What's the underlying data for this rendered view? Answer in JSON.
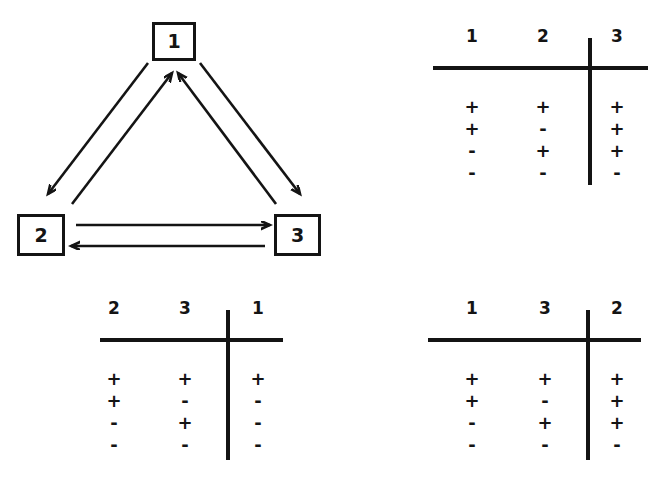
{
  "figure": {
    "kind": "state-transition-diagram-with-truth-tables",
    "background_color": "#ffffff",
    "ink_color": "#141414"
  },
  "diagram": {
    "name": "three-node-cycle",
    "nodes": [
      {
        "id": "1",
        "label": "1"
      },
      {
        "id": "2",
        "label": "2"
      },
      {
        "id": "3",
        "label": "3"
      }
    ],
    "edges": [
      {
        "from": "1",
        "to": "2",
        "direction": "down-left"
      },
      {
        "from": "2",
        "to": "1",
        "direction": "up-right"
      },
      {
        "from": "1",
        "to": "3",
        "direction": "down-right"
      },
      {
        "from": "3",
        "to": "1",
        "direction": "up-left"
      },
      {
        "from": "2",
        "to": "3",
        "direction": "right"
      },
      {
        "from": "3",
        "to": "2",
        "direction": "left"
      }
    ]
  },
  "tables": {
    "top_right": {
      "name": "truth-table-output-3",
      "inputs": [
        "1",
        "2"
      ],
      "output": "3",
      "headers": [
        "1",
        "2",
        "3"
      ],
      "rows": [
        [
          "+",
          "+",
          "+"
        ],
        [
          "+",
          "-",
          "+"
        ],
        [
          "-",
          "+",
          "+"
        ],
        [
          "-",
          "-",
          "-"
        ]
      ]
    },
    "bottom_left": {
      "name": "truth-table-output-1",
      "inputs": [
        "2",
        "3"
      ],
      "output": "1",
      "headers": [
        "2",
        "3",
        "1"
      ],
      "rows": [
        [
          "+",
          "+",
          "+"
        ],
        [
          "+",
          "-",
          "-"
        ],
        [
          "-",
          "+",
          "-"
        ],
        [
          "-",
          "-",
          "-"
        ]
      ]
    },
    "bottom_right": {
      "name": "truth-table-output-2",
      "inputs": [
        "1",
        "3"
      ],
      "output": "2",
      "headers": [
        "1",
        "3",
        "2"
      ],
      "rows": [
        [
          "+",
          "+",
          "+"
        ],
        [
          "+",
          "-",
          "+"
        ],
        [
          "-",
          "+",
          "+"
        ],
        [
          "-",
          "-",
          "-"
        ]
      ]
    }
  }
}
